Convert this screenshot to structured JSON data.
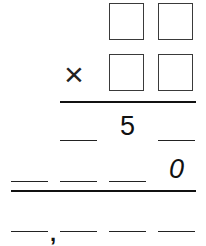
{
  "problem": {
    "type": "vertical multiplication",
    "multiplicand_boxes": [
      "",
      ""
    ],
    "multiplier_operator": "×",
    "multiplier_boxes": [
      "",
      ""
    ],
    "partial_product_1": [
      "",
      "5",
      ""
    ],
    "partial_product_2": [
      "",
      "",
      "",
      "0"
    ],
    "final_product": [
      "",
      "",
      "",
      ""
    ],
    "thousands_separator": ","
  }
}
